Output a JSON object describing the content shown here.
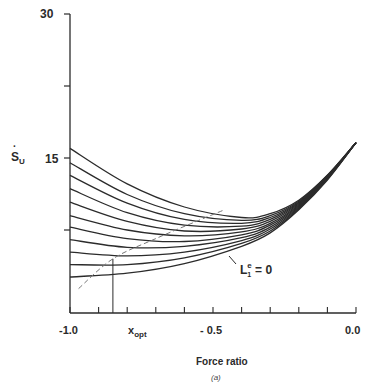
{
  "chart_data": {
    "type": "line",
    "title": "",
    "caption": "(a)",
    "xlabel": "Force ratio",
    "ylabel": "Ṡu",
    "xlim": [
      -1.0,
      0.0
    ],
    "ylim": [
      0,
      30
    ],
    "x_ticks_labeled": [
      -1.0,
      -0.5,
      0.0
    ],
    "x_tick_labels": [
      "-1.0",
      "-0.5",
      "0.0"
    ],
    "x_minor_tick_step": 0.1,
    "y_ticks_labeled": [
      15,
      30
    ],
    "y_tick_labels": [
      "15",
      "30"
    ],
    "y_minor_ticks": [
      7.5,
      22.5
    ],
    "grid": false,
    "annotations": [
      {
        "text": "x_opt",
        "x": -0.85,
        "note": "vertical marker line from x-axis up to dashed optimum locus"
      },
      {
        "text": "L1^e = 0",
        "x": -0.28,
        "y": 4.8,
        "note": "label pointing to lowest curve"
      }
    ],
    "series": [
      {
        "name": "curve-1",
        "x": [
          -1.0,
          -0.8,
          -0.6,
          -0.4,
          -0.3,
          -0.2,
          -0.1,
          0.0
        ],
        "y": [
          16.0,
          12.3,
          9.9,
          8.8,
          9.2,
          10.6,
          13.2,
          16.6
        ]
      },
      {
        "name": "curve-2",
        "x": [
          -1.0,
          -0.8,
          -0.6,
          -0.4,
          -0.3,
          -0.2,
          -0.1,
          0.0
        ],
        "y": [
          14.5,
          11.2,
          9.2,
          8.5,
          9.0,
          10.5,
          13.2,
          16.6
        ]
      },
      {
        "name": "curve-3",
        "x": [
          -1.0,
          -0.8,
          -0.6,
          -0.4,
          -0.3,
          -0.2,
          -0.1,
          0.0
        ],
        "y": [
          13.2,
          10.3,
          8.6,
          8.2,
          8.8,
          10.4,
          13.1,
          16.6
        ]
      },
      {
        "name": "curve-4",
        "x": [
          -1.0,
          -0.8,
          -0.6,
          -0.4,
          -0.3,
          -0.2,
          -0.1,
          0.0
        ],
        "y": [
          11.8,
          9.3,
          8.0,
          7.9,
          8.6,
          10.3,
          13.1,
          16.6
        ]
      },
      {
        "name": "curve-5",
        "x": [
          -1.0,
          -0.8,
          -0.6,
          -0.4,
          -0.3,
          -0.2,
          -0.1,
          0.0
        ],
        "y": [
          10.4,
          8.4,
          7.4,
          7.6,
          8.4,
          10.2,
          13.0,
          16.6
        ]
      },
      {
        "name": "curve-6",
        "x": [
          -1.0,
          -0.8,
          -0.6,
          -0.4,
          -0.3,
          -0.2,
          -0.1,
          0.0
        ],
        "y": [
          9.0,
          7.5,
          6.9,
          7.3,
          8.2,
          10.1,
          13.0,
          16.6
        ]
      },
      {
        "name": "curve-7",
        "x": [
          -1.0,
          -0.8,
          -0.6,
          -0.4,
          -0.3,
          -0.2,
          -0.1,
          0.0
        ],
        "y": [
          7.8,
          6.6,
          6.3,
          7.0,
          8.0,
          10.0,
          12.9,
          16.6
        ]
      },
      {
        "name": "curve-8",
        "x": [
          -1.0,
          -0.8,
          -0.6,
          -0.4,
          -0.3,
          -0.2,
          -0.1,
          0.0
        ],
        "y": [
          6.5,
          5.7,
          5.8,
          6.7,
          7.8,
          9.9,
          12.9,
          16.6
        ]
      },
      {
        "name": "curve-9",
        "x": [
          -1.0,
          -0.8,
          -0.6,
          -0.4,
          -0.3,
          -0.2,
          -0.1,
          0.0
        ],
        "y": [
          5.2,
          4.8,
          5.2,
          6.4,
          7.6,
          9.8,
          12.8,
          16.6
        ]
      },
      {
        "name": "curve-10",
        "x": [
          -1.0,
          -0.8,
          -0.6,
          -0.4,
          -0.3,
          -0.2,
          -0.1,
          0.0
        ],
        "y": [
          3.9,
          3.9,
          4.6,
          6.1,
          7.4,
          9.7,
          12.8,
          16.6
        ]
      },
      {
        "name": "curve-11 (L1^e = 0)",
        "x": [
          -1.0,
          -0.8,
          -0.6,
          -0.4,
          -0.3,
          -0.2,
          -0.1,
          0.0
        ],
        "y": [
          2.6,
          3.0,
          4.0,
          5.8,
          7.2,
          9.6,
          12.7,
          16.6
        ]
      },
      {
        "name": "optimum locus (dashed)",
        "style": "dashed",
        "x": [
          -0.97,
          -0.85,
          -0.7,
          -0.55,
          -0.46
        ],
        "y": [
          1.4,
          4.5,
          6.6,
          8.5,
          9.6
        ]
      }
    ]
  },
  "labels": {
    "y_top": "30",
    "y_mid": "15",
    "ylabel_main": "S",
    "ylabel_sub": "U",
    "x_left": "-1.0",
    "x_mid": "- 0.5",
    "x_right": "0.0",
    "xopt_main": "x",
    "xopt_sub": "opt",
    "xlabel": "Force ratio",
    "caption": "(a)",
    "anno_main": "L",
    "anno_sub": "1",
    "anno_sup": "e",
    "anno_rest": " = 0"
  }
}
